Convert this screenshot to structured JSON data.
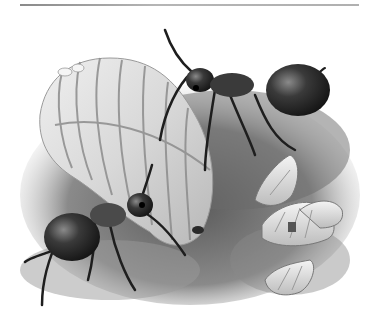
{
  "image": {
    "description": "Grayscale illustration of two ants tending a large segmented queen larva and several smaller curled pupae on a patch of soil",
    "subjects": [
      "worker ant (top right)",
      "worker ant (bottom left)",
      "large segmented larva",
      "small curled pupae"
    ],
    "palette": {
      "background": "#ffffff",
      "rule": "#a0a0a0",
      "soil": "#6e6e6e",
      "soil_dark": "#3a3a3a",
      "larva": "#d6d6d6",
      "larva_highlight": "#f2f2f2",
      "larva_segment": "#8c8c8c",
      "ant_body": "#2a2a2a",
      "ant_highlight": "#7a7a7a"
    }
  }
}
